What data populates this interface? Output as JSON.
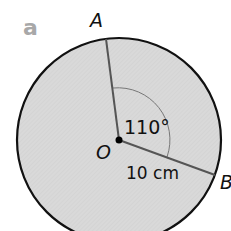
{
  "part_label": "a",
  "points": {
    "A": "A",
    "B": "B",
    "O": "O"
  },
  "angle_label": "110°",
  "radius_label": "10 cm",
  "colors": {
    "fill": "#d6d6d6",
    "stroke": "#111111",
    "radius": "#555555",
    "part": "#a8a8a8"
  }
}
